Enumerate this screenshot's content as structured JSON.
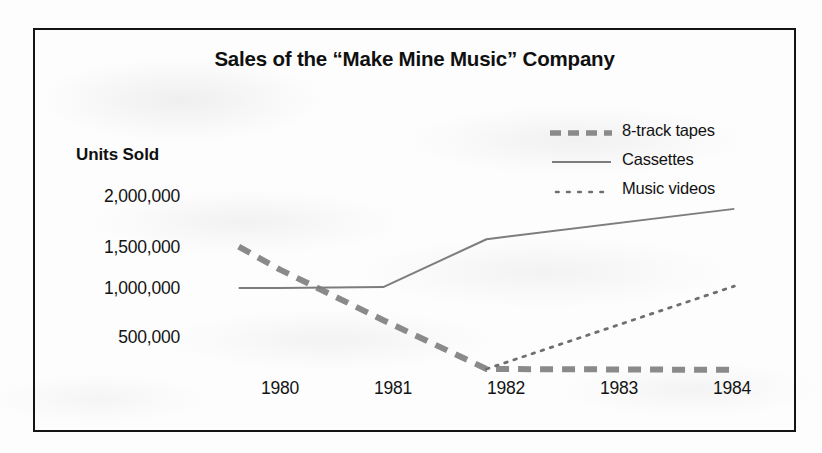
{
  "chart_data": {
    "type": "line",
    "title": "Sales of the “Make Mine Music” Company",
    "xlabel": "",
    "ylabel": "Units Sold",
    "grid": false,
    "legend_position": "top-right",
    "x": [
      "1980",
      "1981",
      "1982",
      "1983",
      "1984"
    ],
    "xlim": [
      1979.6,
      1984.4
    ],
    "ylim": [
      0,
      2250000
    ],
    "yticks": [
      2000000,
      1500000,
      1000000,
      500000
    ],
    "ytick_labels": [
      "2,000,000",
      "1,500,000",
      "1,000,000",
      "500,000"
    ],
    "series": [
      {
        "name": "8-track tapes",
        "style": "dashed",
        "color": "#8a8a8a",
        "x": [
          1979.6,
          1980,
          1981,
          1982,
          1984.4
        ],
        "values": [
          1450000,
          1200000,
          650000,
          120000,
          110000
        ]
      },
      {
        "name": "Cassettes",
        "style": "solid",
        "color": "#7d7d7d",
        "x": [
          1979.6,
          1980,
          1981,
          1982,
          1984.4
        ],
        "values": [
          1000000,
          1000000,
          1010000,
          1530000,
          1860000
        ]
      },
      {
        "name": "Music videos",
        "style": "dotted",
        "color": "#6f6f6f",
        "x": [
          1982,
          1984.4
        ],
        "values": [
          120000,
          1020000
        ]
      }
    ]
  },
  "chart": {
    "title": "Sales of the “Make Mine Music” Company",
    "y_axis_title": "Units Sold",
    "y_ticks": [
      {
        "label": "2,000,000"
      },
      {
        "label": "1,500,000"
      },
      {
        "label": "1,000,000"
      },
      {
        "label": "500,000"
      }
    ],
    "x_ticks": [
      {
        "label": "1980"
      },
      {
        "label": "1981"
      },
      {
        "label": "1982"
      },
      {
        "label": "1983"
      },
      {
        "label": "1984"
      }
    ],
    "legend": [
      {
        "label": "8-track tapes",
        "marker": "dashed-line-icon"
      },
      {
        "label": "Cassettes",
        "marker": "solid-line-icon"
      },
      {
        "label": "Music videos",
        "marker": "dotted-line-icon"
      }
    ],
    "colors": {
      "frame": "#141414",
      "text": "#121212",
      "series_8track": "#8a8a8a",
      "series_cassettes": "#7d7d7d",
      "series_musicvideos": "#6f6f6f",
      "background": "#fdfdfd"
    }
  }
}
